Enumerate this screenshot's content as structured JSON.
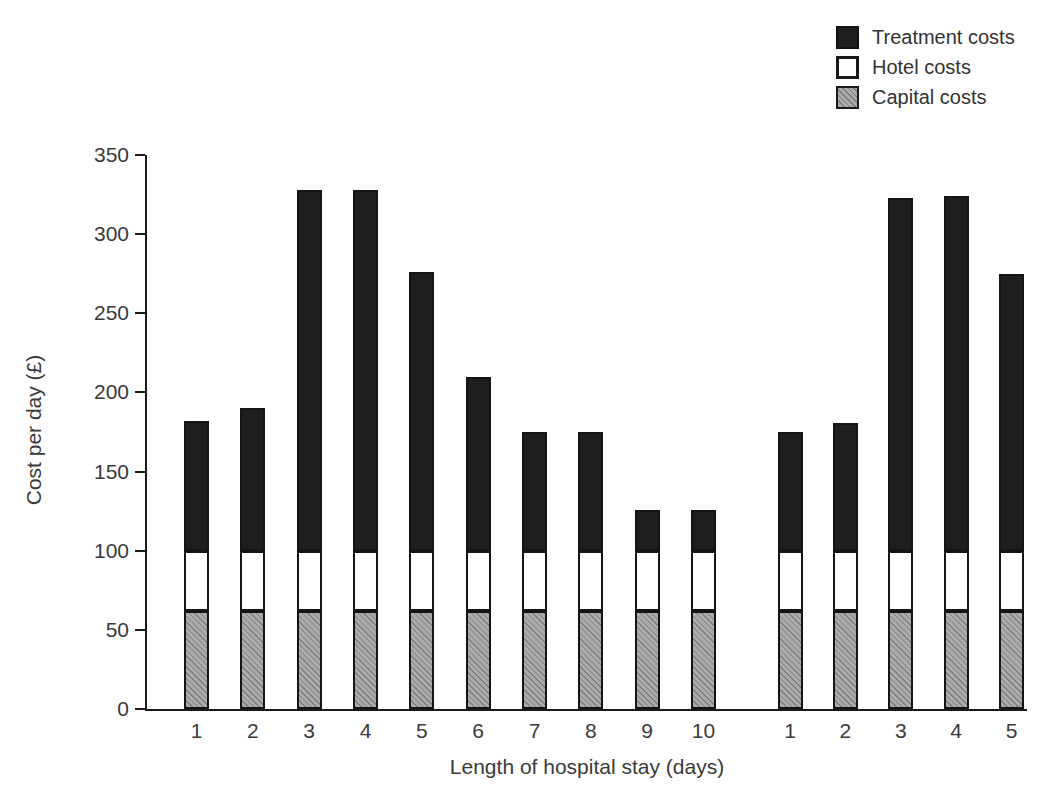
{
  "legend": {
    "position": "top-right",
    "items": [
      {
        "label": "Treatment costs",
        "swatch": "black-square-icon",
        "color": "#1e1e1e"
      },
      {
        "label": "Hotel costs",
        "swatch": "white-square-icon",
        "color": "#ffffff"
      },
      {
        "label": "Capital costs",
        "swatch": "gray-hatched-square-icon",
        "color": "#ababab"
      }
    ]
  },
  "chart_data": {
    "type": "bar",
    "stacked": true,
    "xlabel": "Length of hospital stay (days)",
    "ylabel": "Cost per day (£)",
    "ylim": [
      0,
      350
    ],
    "yticks": [
      0,
      50,
      100,
      150,
      200,
      250,
      300,
      350
    ],
    "grid": false,
    "legend_position": "top-right",
    "groups": [
      {
        "categories": [
          "1",
          "2",
          "3",
          "4",
          "5",
          "6",
          "7",
          "8",
          "9",
          "10"
        ]
      },
      {
        "categories": [
          "1",
          "2",
          "3",
          "4",
          "5"
        ]
      }
    ],
    "stack_order_bottom_to_top": [
      "Capital costs",
      "Hotel costs",
      "Treatment costs"
    ],
    "series": [
      {
        "name": "Capital costs",
        "values": [
          62,
          62,
          62,
          62,
          62,
          62,
          62,
          62,
          62,
          62,
          62,
          62,
          62,
          62,
          62
        ]
      },
      {
        "name": "Hotel costs",
        "values": [
          38,
          38,
          38,
          38,
          38,
          38,
          38,
          38,
          38,
          38,
          38,
          38,
          38,
          38,
          38
        ]
      },
      {
        "name": "Treatment costs",
        "values": [
          82,
          90,
          228,
          228,
          176,
          110,
          75,
          75,
          26,
          26,
          75,
          81,
          223,
          224,
          175
        ]
      }
    ],
    "totals": [
      182,
      190,
      328,
      328,
      276,
      210,
      175,
      175,
      126,
      126,
      175,
      181,
      323,
      324,
      275
    ]
  }
}
